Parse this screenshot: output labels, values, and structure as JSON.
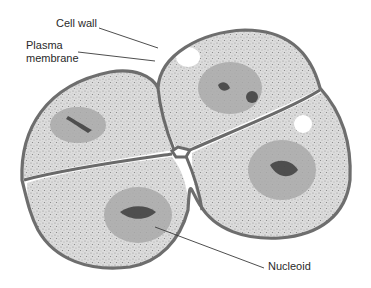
{
  "diagram": {
    "labels": {
      "cell_wall": "Cell wall",
      "plasma_membrane_line1": "Plasma",
      "plasma_membrane_line2": "membrane",
      "nucleoid": "Nucleoid"
    },
    "cells": [
      {
        "name": "top-left-cell"
      },
      {
        "name": "top-right-cell"
      },
      {
        "name": "bottom-left-cell"
      },
      {
        "name": "bottom-right-cell"
      }
    ],
    "colors": {
      "background": "#ffffff",
      "cytoplasm": "#d9d9d9",
      "cell_wall": "#6e6e6e",
      "nucleoid": "#a9a9a9",
      "text": "#2a2a2a"
    }
  }
}
